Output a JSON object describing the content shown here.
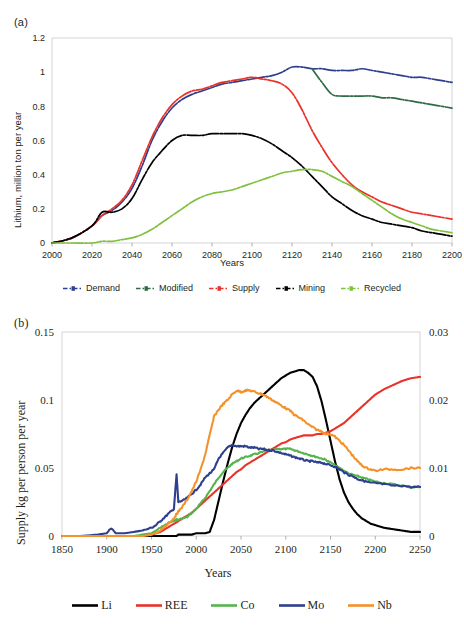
{
  "figure": {
    "panels": [
      {
        "id": "a",
        "label": "(a)",
        "ylabel": "Lithium, million ton per year",
        "xlabel": "Years"
      },
      {
        "id": "b",
        "label": "(b)",
        "ylabel": "Supply kg per person per year",
        "xlabel": "Years"
      }
    ]
  },
  "chart_data": [
    {
      "type": "line",
      "panel": "(a)",
      "title": "",
      "xlabel": "Years",
      "ylabel": "Lithium, million ton per year",
      "xlim": [
        2000,
        2200
      ],
      "ylim": [
        0,
        1.2
      ],
      "xticks": [
        2000,
        2020,
        2040,
        2060,
        2080,
        2100,
        2120,
        2140,
        2160,
        2180,
        2200
      ],
      "yticks": [
        0,
        0.2,
        0.4,
        0.6,
        0.8,
        1,
        1.2
      ],
      "grid": false,
      "legend_position": "bottom",
      "linestyle": "dash-dot with markers",
      "x": [
        2000,
        2010,
        2020,
        2025,
        2030,
        2035,
        2040,
        2045,
        2050,
        2055,
        2060,
        2065,
        2070,
        2075,
        2080,
        2085,
        2090,
        2095,
        2100,
        2105,
        2110,
        2115,
        2120,
        2125,
        2130,
        2135,
        2140,
        2145,
        2150,
        2155,
        2160,
        2165,
        2170,
        2175,
        2180,
        2185,
        2190,
        2195,
        2200
      ],
      "series": [
        {
          "name": "Demand",
          "color": "#2e3f8f",
          "values": [
            0.0,
            0.03,
            0.1,
            0.16,
            0.19,
            0.24,
            0.32,
            0.45,
            0.6,
            0.71,
            0.79,
            0.84,
            0.87,
            0.89,
            0.91,
            0.93,
            0.94,
            0.95,
            0.96,
            0.97,
            0.98,
            1.0,
            1.03,
            1.03,
            1.02,
            1.02,
            1.01,
            1.01,
            1.01,
            1.02,
            1.01,
            1.0,
            0.99,
            0.98,
            0.97,
            0.97,
            0.96,
            0.95,
            0.94
          ]
        },
        {
          "name": "Modified",
          "color": "#2f6b46",
          "values": [
            null,
            null,
            null,
            null,
            null,
            null,
            null,
            null,
            null,
            null,
            null,
            null,
            null,
            null,
            null,
            null,
            null,
            null,
            null,
            null,
            null,
            null,
            null,
            null,
            1.02,
            0.94,
            0.87,
            0.86,
            0.86,
            0.86,
            0.86,
            0.85,
            0.85,
            0.84,
            0.83,
            0.82,
            0.81,
            0.8,
            0.79
          ]
        },
        {
          "name": "Supply",
          "color": "#e8322a",
          "values": [
            0.0,
            0.03,
            0.1,
            0.16,
            0.2,
            0.25,
            0.34,
            0.48,
            0.62,
            0.73,
            0.81,
            0.86,
            0.89,
            0.9,
            0.92,
            0.94,
            0.95,
            0.96,
            0.97,
            0.96,
            0.95,
            0.93,
            0.88,
            0.78,
            0.66,
            0.56,
            0.47,
            0.4,
            0.34,
            0.3,
            0.27,
            0.24,
            0.22,
            0.2,
            0.18,
            0.17,
            0.16,
            0.15,
            0.14
          ]
        },
        {
          "name": "Mining",
          "color": "#000000",
          "values": [
            0.0,
            0.03,
            0.1,
            0.18,
            0.18,
            0.2,
            0.26,
            0.37,
            0.47,
            0.54,
            0.6,
            0.63,
            0.63,
            0.63,
            0.64,
            0.64,
            0.64,
            0.64,
            0.63,
            0.61,
            0.58,
            0.54,
            0.5,
            0.45,
            0.39,
            0.33,
            0.27,
            0.23,
            0.19,
            0.16,
            0.14,
            0.12,
            0.11,
            0.1,
            0.09,
            0.07,
            0.06,
            0.05,
            0.04
          ]
        },
        {
          "name": "Recycled",
          "color": "#7fc040",
          "values": [
            0.0,
            0.0,
            0.0,
            0.01,
            0.01,
            0.02,
            0.03,
            0.05,
            0.08,
            0.12,
            0.16,
            0.2,
            0.24,
            0.27,
            0.29,
            0.3,
            0.31,
            0.33,
            0.35,
            0.37,
            0.39,
            0.41,
            0.42,
            0.43,
            0.43,
            0.42,
            0.39,
            0.36,
            0.33,
            0.29,
            0.25,
            0.21,
            0.17,
            0.14,
            0.12,
            0.1,
            0.08,
            0.07,
            0.06
          ]
        }
      ]
    },
    {
      "type": "line",
      "panel": "(b)",
      "title": "",
      "xlabel": "Years",
      "ylabel": "Supply kg per person per year",
      "xlim": [
        1850,
        2250
      ],
      "ylim": [
        0,
        0.15
      ],
      "ylim_right": [
        0,
        0.03
      ],
      "xticks": [
        1850,
        1900,
        1950,
        2000,
        2050,
        2100,
        2150,
        2200,
        2250
      ],
      "yticks": [
        0,
        0.05,
        0.1,
        0.15
      ],
      "yticks_right": [
        0,
        0.01,
        0.02,
        0.03
      ],
      "grid": false,
      "legend_position": "bottom",
      "x": [
        1850,
        1870,
        1890,
        1900,
        1905,
        1910,
        1920,
        1930,
        1940,
        1950,
        1955,
        1960,
        1965,
        1970,
        1975,
        1978,
        1980,
        1985,
        1990,
        1995,
        2000,
        2005,
        2010,
        2015,
        2020,
        2025,
        2030,
        2035,
        2040,
        2045,
        2050,
        2055,
        2060,
        2065,
        2070,
        2075,
        2080,
        2085,
        2090,
        2095,
        2100,
        2105,
        2110,
        2115,
        2120,
        2125,
        2130,
        2135,
        2140,
        2145,
        2150,
        2155,
        2160,
        2165,
        2170,
        2175,
        2180,
        2185,
        2190,
        2195,
        2200,
        2210,
        2220,
        2230,
        2240,
        2250
      ],
      "series": [
        {
          "name": "Li",
          "color": "#000000",
          "axis": "left",
          "values": [
            0.0,
            0.0,
            0.0,
            0.0,
            0.0,
            0.0,
            0.0,
            0.0,
            0.0,
            0.0,
            0.0,
            0.0,
            0.0,
            0.0,
            0.0,
            0.0,
            0.001,
            0.001,
            0.001,
            0.001,
            0.002,
            0.002,
            0.002,
            0.003,
            0.012,
            0.026,
            0.04,
            0.053,
            0.065,
            0.075,
            0.083,
            0.089,
            0.094,
            0.098,
            0.101,
            0.104,
            0.107,
            0.11,
            0.113,
            0.116,
            0.118,
            0.12,
            0.121,
            0.122,
            0.122,
            0.12,
            0.117,
            0.11,
            0.099,
            0.085,
            0.07,
            0.055,
            0.042,
            0.032,
            0.025,
            0.02,
            0.016,
            0.013,
            0.011,
            0.009,
            0.008,
            0.006,
            0.005,
            0.004,
            0.003,
            0.003
          ]
        },
        {
          "name": "REE",
          "color": "#e8322a",
          "axis": "left",
          "values": [
            0.0,
            0.0,
            0.0,
            0.0,
            0.0,
            0.0,
            0.0,
            0.0,
            0.0,
            0.001,
            0.002,
            0.003,
            0.005,
            0.007,
            0.009,
            0.01,
            0.011,
            0.013,
            0.015,
            0.017,
            0.02,
            0.023,
            0.026,
            0.029,
            0.032,
            0.035,
            0.038,
            0.041,
            0.044,
            0.047,
            0.049,
            0.052,
            0.054,
            0.056,
            0.058,
            0.06,
            0.062,
            0.064,
            0.066,
            0.068,
            0.069,
            0.071,
            0.072,
            0.073,
            0.074,
            0.074,
            0.074,
            0.075,
            0.075,
            0.076,
            0.077,
            0.079,
            0.081,
            0.083,
            0.086,
            0.089,
            0.092,
            0.095,
            0.098,
            0.101,
            0.104,
            0.108,
            0.111,
            0.114,
            0.116,
            0.117
          ]
        },
        {
          "name": "Co",
          "color": "#54b54d",
          "axis": "left",
          "values": [
            0.0,
            0.0,
            0.0,
            0.0,
            0.0,
            0.0,
            0.0,
            0.0,
            0.001,
            0.002,
            0.004,
            0.006,
            0.008,
            0.01,
            0.011,
            0.012,
            0.012,
            0.013,
            0.014,
            0.017,
            0.02,
            0.024,
            0.028,
            0.033,
            0.038,
            0.043,
            0.047,
            0.05,
            0.053,
            0.055,
            0.057,
            0.058,
            0.059,
            0.06,
            0.061,
            0.062,
            0.063,
            0.063,
            0.064,
            0.064,
            0.064,
            0.064,
            0.063,
            0.062,
            0.061,
            0.06,
            0.059,
            0.058,
            0.057,
            0.056,
            0.054,
            0.052,
            0.05,
            0.048,
            0.046,
            0.045,
            0.044,
            0.043,
            0.042,
            0.041,
            0.04,
            0.039,
            0.038,
            0.037,
            0.036,
            0.036
          ]
        },
        {
          "name": "Mo",
          "color": "#2e3f8f",
          "axis": "left",
          "values": [
            0.0,
            0.0,
            0.001,
            0.002,
            0.006,
            0.002,
            0.002,
            0.003,
            0.004,
            0.006,
            0.008,
            0.011,
            0.014,
            0.017,
            0.02,
            0.045,
            0.025,
            0.026,
            0.028,
            0.031,
            0.034,
            0.038,
            0.043,
            0.046,
            0.049,
            0.057,
            0.061,
            0.065,
            0.067,
            0.066,
            0.066,
            0.066,
            0.065,
            0.065,
            0.064,
            0.064,
            0.063,
            0.063,
            0.062,
            0.061,
            0.06,
            0.059,
            0.058,
            0.057,
            0.056,
            0.055,
            0.055,
            0.054,
            0.054,
            0.053,
            0.052,
            0.051,
            0.049,
            0.047,
            0.045,
            0.044,
            0.042,
            0.041,
            0.04,
            0.039,
            0.039,
            0.038,
            0.037,
            0.037,
            0.036,
            0.036
          ]
        },
        {
          "name": "Nb",
          "color": "#f3922b",
          "axis": "left",
          "values": [
            0.0,
            0.0,
            0.0,
            0.0,
            0.0,
            0.0,
            0.0,
            0.0,
            0.0,
            0.001,
            0.002,
            0.004,
            0.007,
            0.01,
            0.013,
            0.016,
            0.018,
            0.022,
            0.027,
            0.033,
            0.04,
            0.049,
            0.06,
            0.074,
            0.088,
            0.093,
            0.097,
            0.1,
            0.104,
            0.107,
            0.106,
            0.107,
            0.107,
            0.106,
            0.105,
            0.104,
            0.102,
            0.1,
            0.098,
            0.096,
            0.094,
            0.092,
            0.089,
            0.087,
            0.085,
            0.082,
            0.08,
            0.078,
            0.077,
            0.075,
            0.075,
            0.073,
            0.07,
            0.067,
            0.063,
            0.059,
            0.055,
            0.052,
            0.05,
            0.049,
            0.048,
            0.049,
            0.049,
            0.049,
            0.05,
            0.05
          ]
        }
      ]
    }
  ],
  "panel_a": {
    "label": "(a)",
    "ylabel": "Lithium, million ton per year",
    "xlabel": "Years",
    "yticks": [
      "1.2",
      "1",
      "0.8",
      "0.6",
      "0.4",
      "0.2",
      "0"
    ],
    "xticks": [
      "2000",
      "2020",
      "2040",
      "2060",
      "2080",
      "2100",
      "2120",
      "2140",
      "2160",
      "2180",
      "2200"
    ],
    "legend": [
      {
        "label": "Demand",
        "color": "#2e3f8f"
      },
      {
        "label": "Modified",
        "color": "#2f6b46"
      },
      {
        "label": "Supply",
        "color": "#e8322a"
      },
      {
        "label": "Mining",
        "color": "#000000"
      },
      {
        "label": "Recycled",
        "color": "#7fc040"
      }
    ]
  },
  "panel_b": {
    "label": "(b)",
    "ylabel": "Supply kg per person per year",
    "xlabel": "Years",
    "yticks_left": [
      "0.15",
      "0.1",
      "0.05",
      "0"
    ],
    "yticks_right": [
      "0.03",
      "0.02",
      "0.01",
      "0"
    ],
    "xticks": [
      "1850",
      "1900",
      "1950",
      "2000",
      "2050",
      "2100",
      "2150",
      "2200",
      "2250"
    ],
    "legend": [
      {
        "label": "Li",
        "color": "#000000"
      },
      {
        "label": "REE",
        "color": "#e8322a"
      },
      {
        "label": "Co",
        "color": "#54b54d"
      },
      {
        "label": "Mo",
        "color": "#2e3f8f"
      },
      {
        "label": "Nb",
        "color": "#f3922b"
      }
    ]
  }
}
